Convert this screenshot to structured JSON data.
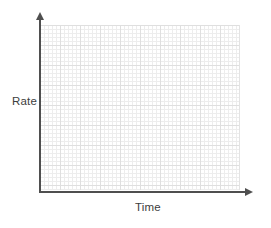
{
  "chart": {
    "ylabel": "Rate",
    "xlabel": "Time"
  },
  "colors": {
    "background": "#ffffff",
    "axis": "#4f4f4f",
    "grid_minor": "#ededed",
    "grid_major": "#dfdfdf",
    "label_text": "#3d3d3d"
  },
  "chart_data": {
    "type": "line",
    "title": "",
    "xlabel": "Time",
    "ylabel": "Rate",
    "x": [],
    "series": [],
    "grid": true,
    "tick_labels": "none",
    "legend": "none",
    "annotations": []
  }
}
